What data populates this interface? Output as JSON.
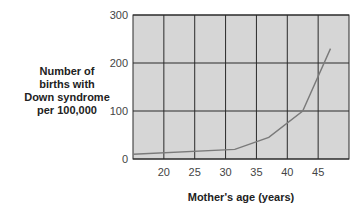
{
  "chart_data": {
    "type": "line",
    "title": "",
    "xlabel": "Mother's age (years)",
    "ylabel_lines": [
      "Number of",
      "births with",
      "Down syndrome",
      "per 100,000"
    ],
    "xlim": [
      15,
      50
    ],
    "ylim": [
      0,
      300
    ],
    "xticks": [
      20,
      25,
      30,
      35,
      40,
      45
    ],
    "yticks": [
      0,
      100,
      200,
      300
    ],
    "grid": true,
    "colors": {
      "plot_bg": "#d6d6d6",
      "grid": "#2a2a2a",
      "line": "#7a7a7a"
    },
    "series": [
      {
        "name": "Down syndrome births",
        "x": [
          15,
          31.5,
          37,
          42.5,
          47
        ],
        "y": [
          10,
          20,
          45,
          100,
          230
        ]
      }
    ]
  }
}
